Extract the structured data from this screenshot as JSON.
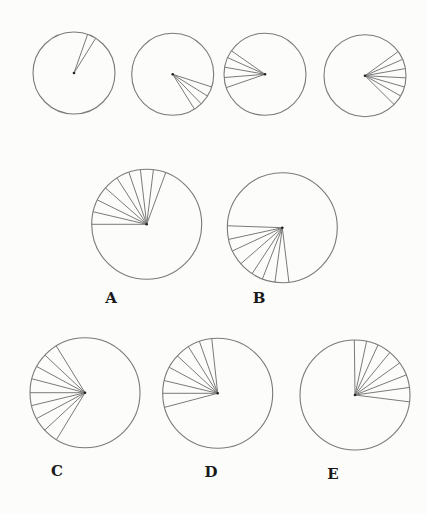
{
  "style": {
    "stroke": "#7a7a7a",
    "background": "#fcfcfb",
    "label_color": "#1a1a1a"
  },
  "sequence": [
    {
      "id": "seq1",
      "cx": 74,
      "cy": 73,
      "r": 41,
      "spoke_angles_deg": [
        -70.6,
        -58.0
      ]
    },
    {
      "id": "seq2",
      "cx": 172.7,
      "cy": 74.3,
      "r": 41,
      "spoke_angles_deg": [
        18,
        32,
        46,
        58
      ]
    },
    {
      "id": "seq3",
      "cx": 265,
      "cy": 74.3,
      "r": 41,
      "spoke_angles_deg": [
        -145,
        -156,
        -170,
        175.5,
        161
      ]
    },
    {
      "id": "seq4",
      "cx": 365,
      "cy": 75.7,
      "r": 41,
      "spoke_angles_deg": [
        -36,
        -23.5,
        -10,
        3,
        16,
        29.6,
        44.7
      ]
    }
  ],
  "options": [
    {
      "id": "A",
      "label": "A",
      "cx": 146.7,
      "cy": 224.3,
      "r": 55,
      "label_x": 111,
      "label_y": 298,
      "spoke_angles_deg": [
        180,
        -166.8,
        -153.7,
        -138.6,
        -122.8,
        -108.9,
        -96.6,
        -83,
        -69.8
      ]
    },
    {
      "id": "B",
      "label": "B",
      "cx": 282.3,
      "cy": 227.7,
      "r": 55,
      "label_x": 259,
      "label_y": 298,
      "spoke_angles_deg": [
        182,
        167.7,
        155,
        139,
        123.3,
        111.2,
        97.7,
        83.1
      ]
    },
    {
      "id": "C",
      "label": "C",
      "cx": 85,
      "cy": 392.7,
      "r": 55,
      "label_x": 57,
      "label_y": 471,
      "spoke_angles_deg": [
        -121.6,
        -136.8,
        -151.5,
        -165.3,
        180,
        166.4,
        151.9,
        137.1,
        121.3
      ]
    },
    {
      "id": "D",
      "label": "D",
      "cx": 217.7,
      "cy": 393.3,
      "r": 55,
      "label_x": 211,
      "label_y": 472,
      "spoke_angles_deg": [
        -96.2,
        -109.4,
        -122.2,
        -137.1,
        -151.8,
        -166.6,
        180,
        165.2
      ]
    },
    {
      "id": "E",
      "label": "E",
      "cx": 355,
      "cy": 395,
      "r": 55,
      "label_x": 333,
      "label_y": 474,
      "spoke_angles_deg": [
        -90.7,
        -77.8,
        -65.3,
        -50.7,
        -35.7,
        -21.4,
        -7.9,
        7.2
      ]
    }
  ]
}
